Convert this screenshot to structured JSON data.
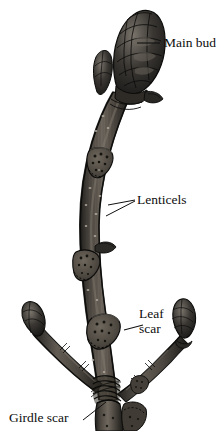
{
  "figure": {
    "subject": "Horse chestnut twig",
    "style": "grayscale botanical engraving",
    "background_color": "#ffffff",
    "ink_color": "#101010"
  },
  "title": {
    "text": "Horse\nchestnut\ntwig"
  },
  "labels": [
    {
      "id": "main-bud",
      "text": "Main bud",
      "leader": "horizontal line to terminal bud"
    },
    {
      "id": "lenticels",
      "text": "Lenticels",
      "leader": "two lines forming a V to stem surface"
    },
    {
      "id": "leaf-scar",
      "text": "Leaf\nscar",
      "leader": "short line to shield-shaped scar"
    },
    {
      "id": "girdle-scar",
      "text": "Girdle scar",
      "leader": "diagonal line up-right to ringed band"
    }
  ],
  "parts": {
    "terminal_bud": "large scaled main bud at top",
    "lateral_buds": "small buds beside main bud and at tips of two lower branches",
    "stem": "curving dark twig with vertical striations",
    "leaf_scars": "three shield-shaped scars with dotted bundle traces",
    "lenticels": "small pale dots scattered on bark",
    "girdle_scar": "band of encircling rings near base",
    "branches": "two side branches diverging near the base"
  },
  "colors": {
    "bark_dark": "#2b2926",
    "bark_mid": "#4a4641",
    "bark_light": "#7d776f",
    "bud_dark": "#1c1b19",
    "bud_light": "#6b665e",
    "scar_fill": "#585249",
    "outline": "#111111"
  }
}
